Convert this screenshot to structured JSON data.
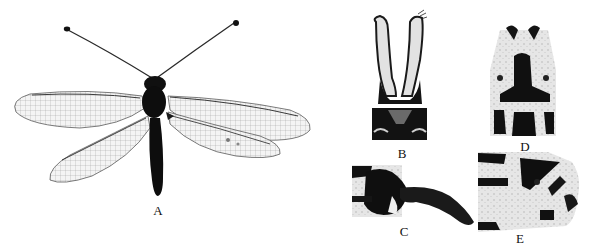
{
  "figure": {
    "background": "#ffffff",
    "ink_color": "#0d0d0d",
    "wing_color": "#d9d9d9",
    "panels": [
      {
        "id": "A",
        "label": "A",
        "subject": "owlfly adult, dorsal habitus (wings spread, clubbed antennae)"
      },
      {
        "id": "B",
        "label": "B",
        "subject": "male terminalia, dorsal view (paired elongate ectoprocts)"
      },
      {
        "id": "C",
        "label": "C",
        "subject": "male terminalia, lateral view"
      },
      {
        "id": "D",
        "label": "D",
        "subject": "female terminalia, ventral view"
      },
      {
        "id": "E",
        "label": "E",
        "subject": "female terminalia, lateral view"
      }
    ]
  }
}
